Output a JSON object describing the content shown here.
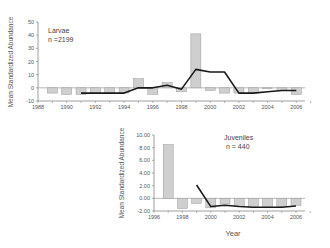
{
  "chart_data": [
    {
      "type": "bar",
      "title": "",
      "annotation": {
        "label": "Larvae",
        "n": "n =2199"
      },
      "xlabel": "",
      "ylabel": "Mean Standardized Abundance",
      "ylim": [
        -10,
        50
      ],
      "yticks": [
        "50",
        "40",
        "30",
        "20",
        "10",
        "0",
        "-10"
      ],
      "xticks": [
        "1988",
        "1990",
        "1992",
        "1994",
        "1996",
        "1998",
        "2000",
        "2002",
        "2004",
        "2006"
      ],
      "grid": false,
      "x": [
        1989,
        1990,
        1991,
        1992,
        1993,
        1994,
        1995,
        1996,
        1997,
        1998,
        1999,
        2000,
        2001,
        2002,
        2003,
        2004,
        2005,
        2006
      ],
      "series": [
        {
          "name": "Annual abundance (bars)",
          "kind": "bar",
          "values": [
            -4,
            -5,
            -5,
            -4,
            -4,
            -4,
            7,
            -5,
            4,
            -3,
            41,
            -2,
            -4,
            -4,
            -4,
            0,
            -2,
            -5
          ]
        },
        {
          "name": "Moving average (line)",
          "kind": "line",
          "x": [
            1991,
            1992,
            1993,
            1994,
            1995,
            1996,
            1997,
            1998,
            1999,
            2000,
            2001,
            2002,
            2003,
            2004,
            2005,
            2006
          ],
          "values": [
            -4,
            -4,
            -4,
            -4,
            0,
            0,
            2,
            -1,
            14,
            12,
            12,
            -4,
            -4,
            -3,
            -2,
            -2
          ]
        }
      ]
    },
    {
      "type": "bar",
      "title": "",
      "annotation": {
        "label": "Juveniles",
        "n": "n = 440"
      },
      "xlabel": "Year",
      "ylabel": "Mean Standardized Abundance",
      "ylim": [
        -2,
        10
      ],
      "yticks": [
        "10.00",
        "8.00",
        "6.00",
        "4.00",
        "2.00",
        "0.00",
        "-2.00"
      ],
      "xticks": [
        "1996",
        "1998",
        "2000",
        "2002",
        "2004",
        "2006"
      ],
      "grid": false,
      "x": [
        1997,
        1998,
        1999,
        2000,
        2001,
        2002,
        2003,
        2004,
        2005,
        2006
      ],
      "series": [
        {
          "name": "Annual abundance (bars)",
          "kind": "bar",
          "values": [
            8.5,
            -1.6,
            -0.8,
            -1.5,
            -0.9,
            -1.3,
            -1.4,
            -1.4,
            -1.3,
            -1.1
          ]
        },
        {
          "name": "Moving average (line)",
          "kind": "line",
          "x": [
            1999,
            2000,
            2001,
            2002,
            2003,
            2004,
            2005,
            2006
          ],
          "values": [
            2.1,
            -1.3,
            -1.1,
            -1.3,
            -1.4,
            -1.4,
            -1.4,
            -1.2
          ]
        }
      ]
    }
  ]
}
